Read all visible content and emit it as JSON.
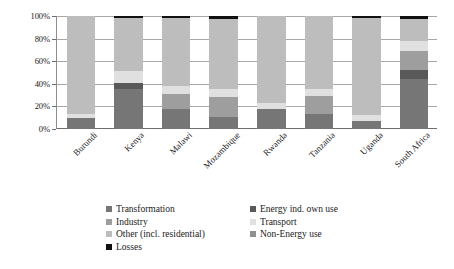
{
  "chart_data": {
    "type": "bar",
    "stacked": true,
    "stack_mode": "percent",
    "title": "",
    "xlabel": "",
    "ylabel": "",
    "ylim": [
      0,
      100
    ],
    "yticks": [
      "0%",
      "20%",
      "40%",
      "60%",
      "80%",
      "100%"
    ],
    "ytick_values": [
      0,
      20,
      40,
      60,
      80,
      100
    ],
    "grid": true,
    "legend_position": "bottom",
    "categories": [
      "Burundi",
      "Kenya",
      "Malawi",
      "Mozambique",
      "Rwanda",
      "Tanzania",
      "Uganda",
      "South Africa"
    ],
    "series": [
      {
        "name": "Transformation",
        "color": "#767676",
        "values": [
          10,
          35,
          18,
          11,
          18,
          13,
          7,
          44
        ]
      },
      {
        "name": "Energy ind. own use",
        "color": "#595959",
        "values": [
          0,
          6,
          0,
          0,
          0,
          0,
          0,
          8
        ]
      },
      {
        "name": "Industry",
        "color": "#9e9e9e",
        "values": [
          0,
          0,
          13,
          17,
          0,
          16,
          0,
          17
        ]
      },
      {
        "name": "Transport",
        "color": "#e0e0e0",
        "values": [
          3,
          10,
          7,
          7,
          5,
          6,
          5,
          9
        ]
      },
      {
        "name": "Other (incl. residential)",
        "color": "#bdbdbd",
        "values": [
          87,
          47,
          60,
          62,
          77,
          65,
          86,
          19
        ]
      },
      {
        "name": "Non-Energy use",
        "color": "#8f8f8f",
        "values": [
          0,
          0,
          0,
          0,
          0,
          0,
          0,
          0
        ]
      },
      {
        "name": "Losses",
        "color": "#111111",
        "values": [
          0,
          2,
          2,
          3,
          0,
          0,
          2,
          3
        ]
      }
    ]
  },
  "legend": {
    "column_left": [
      "Transformation",
      "Industry",
      "Other (incl. residential)",
      "Losses"
    ],
    "column_right": [
      "Energy ind. own use",
      "Transport",
      "Non-Energy use"
    ]
  }
}
